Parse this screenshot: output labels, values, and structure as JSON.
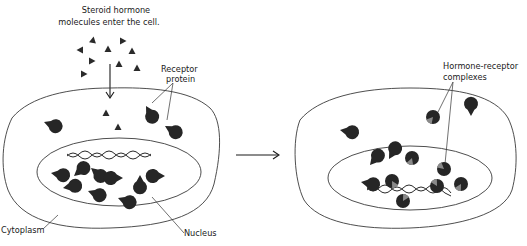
{
  "diagram": {
    "left_panel": {
      "labels": {
        "entry_line1": "Steroid hormone",
        "entry_line2": "molecules enter the cell.",
        "receptor_line1": "Receptor",
        "receptor_line2": "protein",
        "cytoplasm": "Cytoplasm",
        "nucleus": "Nucleus"
      },
      "extracellular_hormones": 10,
      "cytoplasm_hormones": 2,
      "cytoplasm_receptors": 3,
      "nucleus_receptors": 9
    },
    "transition_arrow": "right-arrow",
    "right_panel": {
      "labels": {
        "complex_line1": "Hormone-receptor",
        "complex_line2": "complexes"
      },
      "cytoplasm_receptors_free": 2,
      "cytoplasm_complexes": 1,
      "nucleus_receptors_free": 3,
      "nucleus_complexes": 7
    },
    "colors": {
      "molecule": "#2a2a2a",
      "outline": "#3a3a3a",
      "notch": "#8a8a8a",
      "background": "#ffffff"
    }
  }
}
